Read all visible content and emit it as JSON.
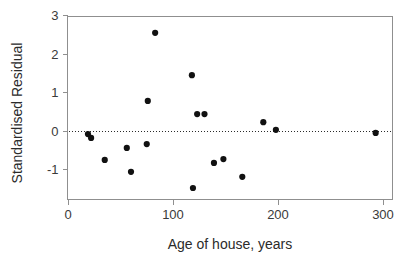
{
  "chart_data": {
    "type": "scatter",
    "title": "",
    "xlabel": "Age of house, years",
    "ylabel": "Standardised Residual",
    "xlim": [
      -8,
      309
    ],
    "ylim": [
      -1.72,
      3.0
    ],
    "xticks": [
      0,
      100,
      200,
      300
    ],
    "xtick_labels": [
      "0",
      "100",
      "200",
      "300"
    ],
    "yticks": [
      -1,
      0,
      1,
      2,
      3
    ],
    "ytick_labels": [
      "-1",
      "0",
      "1",
      "2",
      "3"
    ],
    "grid": false,
    "legend": "none",
    "annotations": [
      {
        "name": "zero-reference-line",
        "kind": "horizontal-dotted-line",
        "y": 0
      }
    ],
    "series": [
      {
        "name": "standardised residuals",
        "marker": "filled-circle",
        "color": "#111111",
        "points": [
          {
            "x": 19,
            "y": -0.08
          },
          {
            "x": 22,
            "y": -0.18
          },
          {
            "x": 35,
            "y": -0.75
          },
          {
            "x": 56,
            "y": -0.44
          },
          {
            "x": 60,
            "y": -1.06
          },
          {
            "x": 75,
            "y": -0.34
          },
          {
            "x": 76,
            "y": 0.78
          },
          {
            "x": 83,
            "y": 2.55
          },
          {
            "x": 118,
            "y": 1.45
          },
          {
            "x": 119,
            "y": -1.48
          },
          {
            "x": 123,
            "y": 0.44
          },
          {
            "x": 130,
            "y": 0.44
          },
          {
            "x": 139,
            "y": -0.83
          },
          {
            "x": 148,
            "y": -0.73
          },
          {
            "x": 166,
            "y": -1.19
          },
          {
            "x": 186,
            "y": 0.23
          },
          {
            "x": 198,
            "y": 0.03
          },
          {
            "x": 293,
            "y": -0.05
          }
        ]
      }
    ]
  },
  "style": {
    "point_color": "#111111",
    "frame_color": "#8f8f8f",
    "text_color": "#2b2b2b",
    "tick_text_color": "#3a3a3a",
    "background": "#ffffff",
    "point_radius": 3.1
  }
}
